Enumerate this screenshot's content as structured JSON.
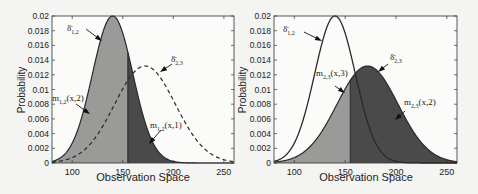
{
  "chart_data": [
    {
      "type": "area",
      "panel": "left",
      "title": "",
      "xlabel": "Observation Space",
      "ylabel": "Probability",
      "xlim": [
        80,
        260
      ],
      "ylim": [
        0,
        0.02
      ],
      "xticks": [
        "100",
        "150",
        "200",
        "250"
      ],
      "yticks": [
        "0",
        "0.002",
        "0.004",
        "0.006",
        "0.008",
        "0.01",
        "0.012",
        "0.014",
        "0.016",
        "0.018",
        "0.02"
      ],
      "split_x": 155,
      "series": [
        {
          "name": "δ1,2",
          "mean": 140,
          "peak": 0.02,
          "sigma": 20,
          "style": "solid"
        },
        {
          "name": "δ2,3",
          "mean": 172,
          "peak": 0.0132,
          "sigma": 30,
          "style": "dashed"
        }
      ],
      "annotations": [
        {
          "label": "δ̄1,2",
          "sub": "1,2",
          "base": "δ̄"
        },
        {
          "label": "δ̄2,3",
          "sub": "2,3",
          "base": "δ̄"
        },
        {
          "label": "m1,2(x,2)",
          "sub": "1,2",
          "base": "m",
          "arg": "(x,2)"
        },
        {
          "label": "m1,2(x,1)",
          "sub": "1,2",
          "base": "m",
          "arg": "(x,1)"
        }
      ]
    },
    {
      "type": "area",
      "panel": "right",
      "title": "",
      "xlabel": "Observation Space",
      "ylabel": "Probability",
      "xlim": [
        80,
        260
      ],
      "ylim": [
        0,
        0.02
      ],
      "xticks": [
        "100",
        "150",
        "200",
        "250"
      ],
      "yticks": [
        "0",
        "0.002",
        "0.004",
        "0.006",
        "0.008",
        "0.01",
        "0.012",
        "0.014",
        "0.016",
        "0.018",
        "0.02"
      ],
      "split_x": 155,
      "series": [
        {
          "name": "δ1,2",
          "mean": 140,
          "peak": 0.02,
          "sigma": 20,
          "style": "solid"
        },
        {
          "name": "δ2,3",
          "mean": 172,
          "peak": 0.0132,
          "sigma": 30,
          "style": "solid"
        }
      ],
      "annotations": [
        {
          "label": "δ̄1,2",
          "sub": "1,2",
          "base": "δ̄"
        },
        {
          "label": "δ̄2,3",
          "sub": "2,3",
          "base": "δ̄"
        },
        {
          "label": "m2,3(x,3)",
          "sub": "2,3",
          "base": "m",
          "arg": "(x,3)"
        },
        {
          "label": "m2,3(x,2)",
          "sub": "2,3",
          "base": "m",
          "arg": "(x,2)"
        }
      ]
    }
  ],
  "colors": {
    "light_fill": "#9a9a98",
    "dark_fill": "#4a4a4a",
    "line": "#2a2a2a",
    "background": "#f4f4f2"
  }
}
